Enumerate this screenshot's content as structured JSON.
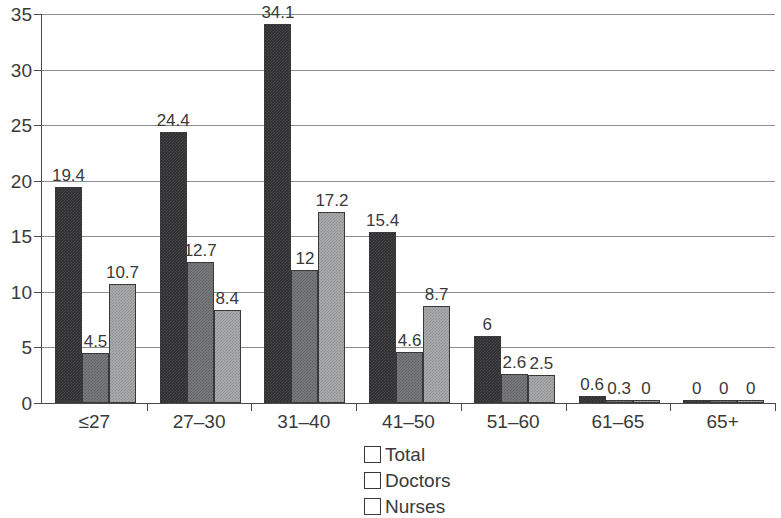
{
  "chart_data": {
    "type": "bar",
    "title": "",
    "subtitle": "",
    "xlabel": "",
    "ylabel": "",
    "ylim": [
      0,
      35
    ],
    "ytick_step": 5,
    "yticks": [
      "0",
      "5",
      "10",
      "15",
      "20",
      "25",
      "30",
      "35"
    ],
    "grid": true,
    "legend_position": "bottom-center",
    "categories": [
      "≤27",
      "27–30",
      "31–40",
      "41–50",
      "51–60",
      "61–65",
      "65+"
    ],
    "series": [
      {
        "name": "Total",
        "color": "#2f2f31",
        "values": [
          19.4,
          24.4,
          34.1,
          15.4,
          6,
          0.6,
          0
        ],
        "labels": [
          "19.4",
          "24.4",
          "34.1",
          "15.4",
          "6",
          "0.6",
          "0"
        ]
      },
      {
        "name": "Doctors",
        "color": "#797a7c",
        "values": [
          4.5,
          12.7,
          12,
          4.6,
          2.6,
          0.3,
          0
        ],
        "labels": [
          "4.5",
          "12.7",
          "12",
          "4.6",
          "2.6",
          "0.3",
          "0"
        ]
      },
      {
        "name": "Nurses",
        "color": "#a9aaac",
        "values": [
          10.7,
          8.4,
          17.2,
          8.7,
          2.5,
          0,
          0
        ],
        "labels": [
          "10.7",
          "8.4",
          "17.2",
          "8.7",
          "2.5",
          "0",
          "0"
        ]
      }
    ]
  },
  "legend": {
    "entries": [
      {
        "label": "Total",
        "color": "#2f2f31"
      },
      {
        "label": "Doctors",
        "color": "#797a7c"
      },
      {
        "label": "Nurses",
        "color": "#a9aaac"
      }
    ]
  },
  "axis": {
    "line_color": "#4a4a4a",
    "grid_color": "#8d8d8d"
  }
}
